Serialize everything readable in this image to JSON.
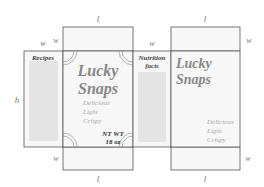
{
  "diagram": {
    "dimension_labels": {
      "top_front_l": "l",
      "top_back_l": "l",
      "bottom_front_l": "l",
      "bottom_back_l": "l",
      "left_w_outer": "w",
      "left_w_inner": "w",
      "nutrition_w": "w",
      "right_w_top": "w",
      "left_bottom_w": "w",
      "right_bottom_w": "w",
      "height_h": "h"
    },
    "panels": {
      "left_side": {
        "heading": "Recipes"
      },
      "front": {
        "brand_line1": "Lucky",
        "brand_line2": "Snaps",
        "tagline": [
          "Delicious",
          "Light",
          "Crispy"
        ],
        "net_weight_line1": "NT WT",
        "net_weight_line2": "18 oz"
      },
      "right_side": {
        "heading_line1": "Nutrition",
        "heading_line2": "facts"
      },
      "back": {
        "brand_line1": "Lucky",
        "brand_line2": "Snaps",
        "tagline": [
          "Delicious",
          "Light",
          "Crispy"
        ]
      }
    },
    "colors": {
      "stroke": "#555555",
      "panel_fill": "#f7f7f7",
      "text_lines": "#bbbbbb",
      "brand_text": "#888888",
      "tagline_text": "#aaaaaa"
    }
  }
}
